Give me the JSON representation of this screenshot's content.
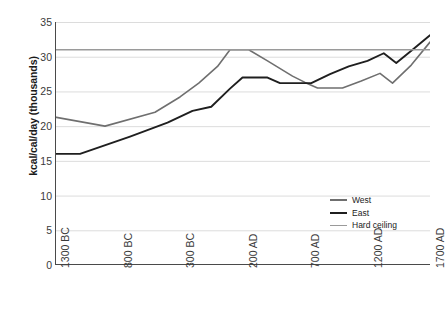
{
  "chart_data": {
    "type": "line",
    "title": "",
    "xlabel": "",
    "ylabel": "kcal/cal/day (thousands)",
    "ylim": [
      0,
      35
    ],
    "ytick_step": 5,
    "yticks": [
      "0",
      "5",
      "10",
      "15",
      "20",
      "25",
      "30",
      "35"
    ],
    "categories": [
      "1300 BC",
      "800 BC",
      "300 BC",
      "200 AD",
      "700 AD",
      "1200 AD",
      "1700 AD"
    ],
    "xtick_labels": [
      "1300 BC",
      "800 BC",
      "300 BC",
      "200 AD",
      "700 AD",
      "1200 AD",
      "1700 AD"
    ],
    "xlim_years": [
      -1300,
      1700
    ],
    "grid": true,
    "grid_axis": "y",
    "legend_position": "inside-bottom-right",
    "series": [
      {
        "name": "West",
        "color": "#6f6f6f",
        "width": 1.6,
        "points": [
          {
            "x": -1300,
            "y": 21.3
          },
          {
            "x": -900,
            "y": 20.0
          },
          {
            "x": -500,
            "y": 22.0
          },
          {
            "x": -300,
            "y": 24.2
          },
          {
            "x": -150,
            "y": 26.2
          },
          {
            "x": 0,
            "y": 28.6
          },
          {
            "x": 100,
            "y": 31.0
          },
          {
            "x": 250,
            "y": 31.0
          },
          {
            "x": 400,
            "y": 29.4
          },
          {
            "x": 600,
            "y": 27.2
          },
          {
            "x": 700,
            "y": 26.3
          },
          {
            "x": 800,
            "y": 25.5
          },
          {
            "x": 1000,
            "y": 25.5
          },
          {
            "x": 1150,
            "y": 26.5
          },
          {
            "x": 1300,
            "y": 27.6
          },
          {
            "x": 1400,
            "y": 26.2
          },
          {
            "x": 1550,
            "y": 28.8
          },
          {
            "x": 1700,
            "y": 32.1
          }
        ]
      },
      {
        "name": "East",
        "color": "#1f1f1f",
        "width": 1.9,
        "points": [
          {
            "x": -1300,
            "y": 16.0
          },
          {
            "x": -1100,
            "y": 16.0
          },
          {
            "x": -700,
            "y": 18.5
          },
          {
            "x": -400,
            "y": 20.5
          },
          {
            "x": -200,
            "y": 22.2
          },
          {
            "x": -50,
            "y": 22.8
          },
          {
            "x": 100,
            "y": 25.4
          },
          {
            "x": 200,
            "y": 27.0
          },
          {
            "x": 400,
            "y": 27.0
          },
          {
            "x": 500,
            "y": 26.2
          },
          {
            "x": 750,
            "y": 26.2
          },
          {
            "x": 900,
            "y": 27.5
          },
          {
            "x": 1050,
            "y": 28.6
          },
          {
            "x": 1200,
            "y": 29.4
          },
          {
            "x": 1330,
            "y": 30.5
          },
          {
            "x": 1430,
            "y": 29.1
          },
          {
            "x": 1560,
            "y": 31.0
          },
          {
            "x": 1700,
            "y": 33.1
          }
        ]
      },
      {
        "name": "Hard ceiling",
        "color": "#9a9a9a",
        "width": 1.5,
        "points": [
          {
            "x": -1300,
            "y": 31.0
          },
          {
            "x": 1700,
            "y": 31.0
          }
        ]
      }
    ],
    "legend_entries": [
      {
        "label": "West",
        "color": "#6f6f6f",
        "width": 2.4
      },
      {
        "label": "East",
        "color": "#1f1f1f",
        "width": 2.8
      },
      {
        "label": "Hard ceiling",
        "color": "#9a9a9a",
        "width": 1.6
      }
    ]
  },
  "colors": {
    "background": "#ffffff",
    "axis": "#4a4a4a",
    "grid": "#dcdcdc",
    "text": "#3a3a3a"
  }
}
